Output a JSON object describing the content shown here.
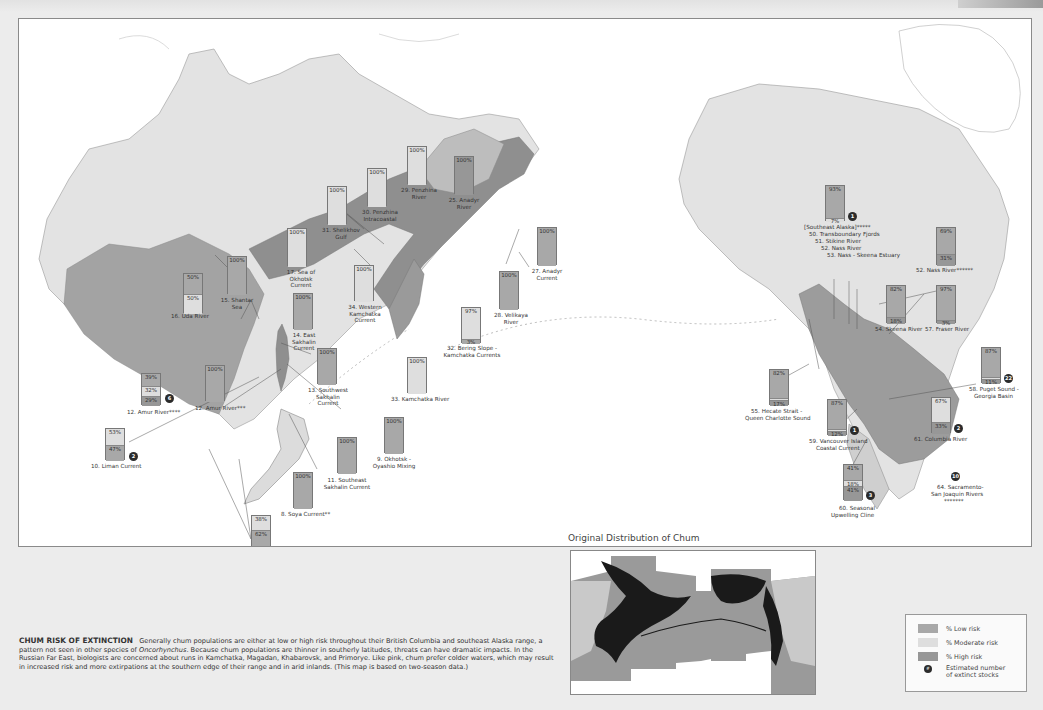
{
  "header": {
    "title": "Chum Risk of Extinction"
  },
  "colors": {
    "low": "#a8a8a8",
    "moderate": "#dedede",
    "high": "#979797",
    "extinct": "#2b2b2b",
    "land_base": "#e3e3e3",
    "ocean": "#ffffff"
  },
  "map": {
    "stocks": [
      {
        "id": "s16",
        "label": "16. Uda River",
        "low": 50,
        "moderate": 50,
        "high": 0,
        "segments": [
          "50%",
          "50%"
        ]
      },
      {
        "id": "s15",
        "label": "15. Shantar Sea",
        "segments": [
          "100%"
        ]
      },
      {
        "id": "s17",
        "label": "17. Sea of Okhotsk Current",
        "segments": [
          "100%"
        ]
      },
      {
        "id": "s31",
        "label": "31. Shelikhov Gulf",
        "segments": [
          "100%"
        ]
      },
      {
        "id": "s30",
        "label": "30. Penzhina Intracoastal",
        "segments": [
          "100%"
        ]
      },
      {
        "id": "s29",
        "label": "29. Penzhina River",
        "segments": [
          "100%"
        ]
      },
      {
        "id": "s25",
        "label": "25. Anadyr River",
        "segments": [
          "100%"
        ]
      },
      {
        "id": "s27",
        "label": "27. Anadyr Current",
        "segments": [
          "100%"
        ]
      },
      {
        "id": "s28",
        "label": "28. Velikaya River",
        "segments": [
          "100%"
        ]
      },
      {
        "id": "s32",
        "label": "32. Bering Slope - Kamchatka Currents",
        "segments": [
          "97%",
          "3%"
        ]
      },
      {
        "id": "s33",
        "label": "33. Kamchatka River",
        "segments": [
          "100%"
        ]
      },
      {
        "id": "s34",
        "label": "34. Western Kamchatka Current",
        "segments": [
          "100%"
        ]
      },
      {
        "id": "s14",
        "label": "14. East Sakhalin Current",
        "segments": [
          "100%"
        ]
      },
      {
        "id": "s13",
        "label": "13. Southwest Sakhalin Current",
        "segments": [
          "100%"
        ]
      },
      {
        "id": "s12a",
        "label": "12. Amur River****",
        "segments": [
          "39%",
          "32%",
          "29%"
        ],
        "extinct": "6"
      },
      {
        "id": "s12b",
        "label": "12. Amur River***",
        "segments": [
          "100%"
        ]
      },
      {
        "id": "s10",
        "label": "10. Liman Current",
        "segments": [
          "53%",
          "47%"
        ],
        "extinct": "2"
      },
      {
        "id": "s11",
        "label": "11. Southeast Sakhalin Current",
        "segments": [
          "100%"
        ]
      },
      {
        "id": "s9",
        "label": "9. Okhotsk - Oyashio Mixing",
        "segments": [
          "100%"
        ]
      },
      {
        "id": "s8",
        "label": "8. Soya Current**",
        "segments": [
          "100%"
        ]
      },
      {
        "id": "s5",
        "label": "5. North Korean Current*",
        "label2": "7. Primorsky Current*",
        "segments": [
          "38%",
          "62%"
        ]
      },
      {
        "id": "sSEA",
        "label": "[Southeast Alaska]*****",
        "segments": [
          "93%",
          "7%"
        ],
        "extinct": "1"
      },
      {
        "id": "s52",
        "label": "52. Nass River******",
        "segments": [
          "69%",
          "31%"
        ]
      },
      {
        "id": "s54",
        "label": "54. Skeena River",
        "segments": [
          "82%",
          "18%"
        ]
      },
      {
        "id": "s57",
        "label": "57. Fraser River",
        "segments": [
          "97%",
          "3%"
        ]
      },
      {
        "id": "s55",
        "label": "55. Hecate Strait -",
        "label2": "Queen Charlotte Sound",
        "segments": [
          "82%",
          "1%",
          "17%"
        ]
      },
      {
        "id": "s59",
        "label": "59. Vancouver Island",
        "label2": "Coastal Current",
        "segments": [
          "87%",
          "1%",
          "12%"
        ],
        "extinct": "1"
      },
      {
        "id": "s61",
        "label": "61. Columbia River",
        "segments": [
          "67%",
          "33%"
        ],
        "extinct": "2"
      },
      {
        "id": "s58",
        "label": "58. Puget Sound -",
        "label2": "Georgia Basin",
        "segments": [
          "87%",
          "2%",
          "11%"
        ],
        "extinct": "22"
      },
      {
        "id": "s60",
        "label": "60. Seasonal",
        "label2": "Upwelling Cline",
        "segments": [
          "41%",
          "18%",
          "41%"
        ],
        "extinct": "3"
      },
      {
        "id": "s64",
        "label": "64. Sacramento-",
        "label2": "San Joaquin Rivers",
        "label3": "*******",
        "extinct": "10"
      }
    ],
    "seak_list": [
      "50. Transboundary Fjords",
      "51. Stikine River",
      "52. Nass River",
      "53. Nass - Skeena Estuary"
    ]
  },
  "inset": {
    "title": "Original Distribution of Chum"
  },
  "caption": {
    "title": "CHUM RISK OF EXTINCTION",
    "text_before_italic": "Generally chum populations are either at low or high risk throughout their British Columbia and southeast Alaska range, a pattern not seen in other species of ",
    "italic": "Oncorhynchus",
    "text_after_italic": ". Because chum populations are thinner in southerly latitudes, threats can have dramatic impacts. In the Russian Far East, biologists are concerned about runs in Kamchatka, Magadan, Khabarovsk, and Primorye. Like pink, chum prefer colder waters, which may result in increased risk and more extirpations at the southern edge of their range and in arid inlands. (This map is based on two-season data.)"
  },
  "legend": {
    "items": [
      {
        "label": "% Low risk"
      },
      {
        "label": "% Moderate risk"
      },
      {
        "label": "% High risk"
      },
      {
        "label": "Estimated number of extinct stocks",
        "line1": "Estimated number",
        "line2": "of extinct stocks",
        "symbol": "#"
      }
    ]
  }
}
